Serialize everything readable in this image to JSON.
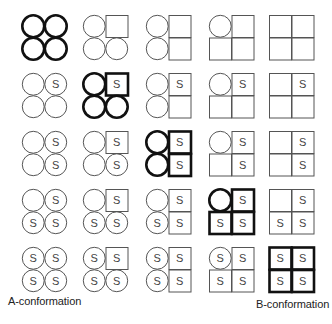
{
  "diagram": {
    "type": "conformation-transition-grid",
    "rows": 5,
    "cols": 5,
    "subunit_order": [
      "top-left",
      "top-right",
      "bottom-left",
      "bottom-right"
    ],
    "subunit_marker": "S",
    "column_square_subunits": [
      [],
      [
        1
      ],
      [
        1,
        3
      ],
      [
        1,
        2,
        3
      ],
      [
        0,
        1,
        2,
        3
      ]
    ],
    "row_s_subunits": [
      [],
      [
        1
      ],
      [
        1,
        3
      ],
      [
        1,
        2,
        3
      ],
      [
        0,
        1,
        2,
        3
      ]
    ],
    "highlight": "diagonal",
    "shape_legend": {
      "circle": "A-state subunit",
      "square": "B-state subunit"
    },
    "colors": {
      "stroke_normal": "#555555",
      "stroke_bold": "#111111",
      "text": "#444444",
      "background": "#ffffff"
    }
  },
  "labels": {
    "left": "A-conformation",
    "right": "B-conformation"
  }
}
